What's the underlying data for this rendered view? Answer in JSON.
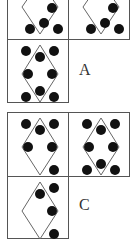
{
  "puzzle": {
    "top_group": {
      "label": "A",
      "cells": [
        {
          "id": "a1",
          "dots": [
            [
              44,
              7
            ],
            [
              22,
              28
            ],
            [
              36,
              22
            ],
            [
              50,
              28
            ]
          ]
        },
        {
          "id": "a2",
          "dots": [
            [
              44,
              7
            ],
            [
              22,
              28
            ],
            [
              36,
              22
            ],
            [
              50,
              28
            ]
          ]
        },
        {
          "id": "a3",
          "dots": [
            [
              18,
              11
            ],
            [
              32,
              17
            ],
            [
              46,
              11
            ],
            [
              20,
              34
            ],
            [
              44,
              34
            ],
            [
              32,
              51
            ],
            [
              18,
              57
            ],
            [
              46,
              57
            ]
          ]
        }
      ]
    },
    "bottom_group": {
      "label": "C",
      "cells": [
        {
          "id": "c1",
          "dots": [
            [
              18,
              11
            ],
            [
              32,
              17
            ],
            [
              46,
              11
            ],
            [
              20,
              34
            ],
            [
              44,
              34
            ],
            [
              46,
              57
            ]
          ]
        },
        {
          "id": "c2",
          "dots": [
            [
              18,
              11
            ],
            [
              32,
              17
            ],
            [
              46,
              11
            ],
            [
              20,
              34
            ],
            [
              44,
              34
            ],
            [
              32,
              51
            ],
            [
              18,
              57
            ],
            [
              46,
              57
            ]
          ]
        },
        {
          "id": "c3",
          "dots": [
            [
              32,
              17
            ],
            [
              46,
              11
            ],
            [
              44,
              34
            ],
            [
              46,
              57
            ]
          ]
        }
      ]
    }
  }
}
